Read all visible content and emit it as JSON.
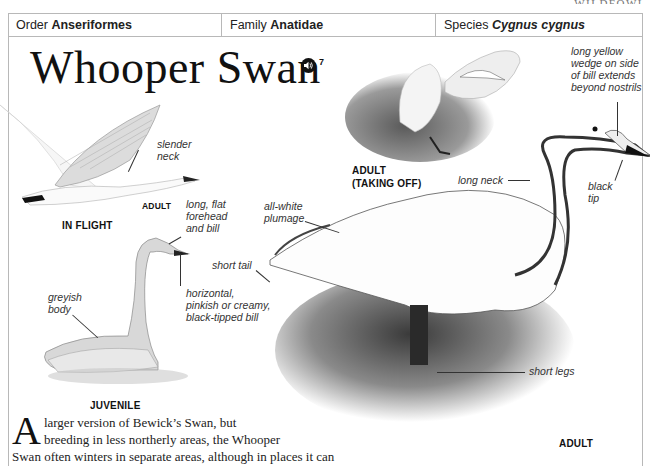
{
  "running_head": "WILDFOWL",
  "taxonomy": {
    "order_label": "Order",
    "order_value": "Anseriformes",
    "family_label": "Family",
    "family_value": "Anatidae",
    "species_label": "Species",
    "species_value": "Cygnus cygnus"
  },
  "title": "Whooper Swan",
  "audio": {
    "icon": "speaker-icon",
    "track_number": "7"
  },
  "illustrations": {
    "in_flight": {
      "caption": "IN FLIGHT",
      "sub_caption": "ADULT",
      "annotations": [
        "slender neck"
      ]
    },
    "juvenile": {
      "caption": "JUVENILE",
      "annotations": [
        "long, flat forehead and bill",
        "horizontal, pinkish or creamy, black-tipped bill",
        "greyish body"
      ]
    },
    "adult_taking_off": {
      "caption_line1": "ADULT",
      "caption_line2": "(TAKING OFF)"
    },
    "adult": {
      "caption": "ADULT",
      "annotations": [
        "long yellow wedge on side of bill extends beyond nostrils",
        "long neck",
        "black tip",
        "all-white plumage",
        "short tail",
        "short legs"
      ]
    }
  },
  "labels": {
    "slender_neck_1": "slender",
    "slender_neck_2": "neck",
    "forehead_1": "long, flat",
    "forehead_2": "forehead",
    "forehead_3": "and bill",
    "bill_1": "horizontal,",
    "bill_2": "pinkish or creamy,",
    "bill_3": "black-tipped bill",
    "greyish_1": "greyish",
    "greyish_2": "body",
    "wedge_1": "long yellow",
    "wedge_2": "wedge on side",
    "wedge_3": "of bill extends",
    "wedge_4": "beyond nostrils",
    "long_neck": "long neck",
    "black_tip_1": "black",
    "black_tip_2": "tip",
    "plumage_1": "all-white",
    "plumage_2": "plumage",
    "short_tail": "short tail",
    "short_legs": "short legs"
  },
  "body": {
    "dropcap": "A",
    "line1": "larger version of Bewick’s Swan, but",
    "line2": "breeding in less northerly areas, the Whooper",
    "line3": "Swan often winters in separate areas, although in places it can"
  }
}
